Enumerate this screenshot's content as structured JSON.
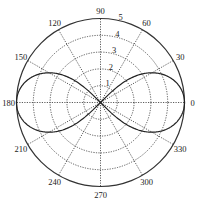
{
  "chart_data": {
    "type": "line",
    "projection": "polar",
    "title": "",
    "equation": "r^2 = 25 cos(2θ)",
    "curve_description": "Lemniscate with lobes along 0° and 180°, reaching r = 5 at θ = 0° and θ = 180°, passing through origin at θ = 45°, 135°, 225°, 315°",
    "series": [
      {
        "name": "lemniscate",
        "theta_deg": [
          0,
          10,
          20,
          30,
          35,
          40,
          45,
          135,
          140,
          145,
          150,
          160,
          170,
          180,
          190,
          200,
          210,
          215,
          220,
          225,
          315,
          320,
          325,
          330,
          340,
          350,
          360
        ],
        "r": [
          5.0,
          4.85,
          4.38,
          3.54,
          2.87,
          2.04,
          0.0,
          0.0,
          2.04,
          2.87,
          3.54,
          4.38,
          4.85,
          5.0,
          4.85,
          4.38,
          3.54,
          2.87,
          2.04,
          0.0,
          0.0,
          2.04,
          2.87,
          3.54,
          4.38,
          4.85,
          5.0
        ],
        "color": "#222222",
        "style": "solid"
      }
    ],
    "angular_ticks": [
      "0",
      "30",
      "60",
      "90",
      "120",
      "150",
      "180",
      "210",
      "240",
      "270",
      "300",
      "330"
    ],
    "angular_tick_values_deg": [
      0,
      30,
      60,
      90,
      120,
      150,
      180,
      210,
      240,
      270,
      300,
      330
    ],
    "radial_ticks": [
      "1",
      "2",
      "3",
      "4",
      "5"
    ],
    "radial_tick_values": [
      1,
      2,
      3,
      4,
      5
    ],
    "rlim": [
      0,
      5
    ],
    "grid": true,
    "grid_style": "dotted",
    "legend": null
  }
}
